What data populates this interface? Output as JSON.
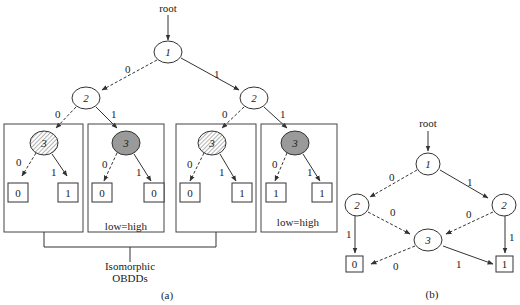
{
  "figure_a": {
    "root_label": "root",
    "nodes": {
      "n1": "1",
      "n2_left": "2",
      "n2_right": "2",
      "n3": "3"
    },
    "edge_labels": {
      "zero": "0",
      "one": "1"
    },
    "subgraphs": [
      {
        "node": "3",
        "style": "hatched",
        "low_terminal": "0",
        "high_terminal": "1"
      },
      {
        "node": "3",
        "style": "gray",
        "low_terminal": "0",
        "high_terminal": "0"
      },
      {
        "node": "3",
        "style": "hatched",
        "low_terminal": "0",
        "high_terminal": "1"
      },
      {
        "node": "3",
        "style": "gray",
        "low_terminal": "1",
        "high_terminal": "1"
      }
    ],
    "annotation_low_high_1": "low=high",
    "annotation_low_high_2": "low=high",
    "annotation_isomorphic_line1": "Isomorphic",
    "annotation_isomorphic_line2": "OBDDs",
    "caption": "(a)"
  },
  "figure_b": {
    "root_label": "root",
    "nodes": {
      "n1": "1",
      "n2_left": "2",
      "n2_right": "2",
      "n3": "3"
    },
    "terminals": {
      "t0": "0",
      "t1": "1"
    },
    "edge_labels": {
      "zero": "0",
      "one": "1"
    },
    "caption": "(b)"
  }
}
